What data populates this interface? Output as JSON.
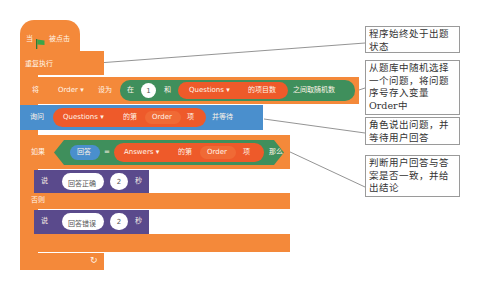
{
  "hat": {
    "prefix": "当",
    "flag_icon": "green-flag-icon",
    "suffix": "被点击"
  },
  "forever": {
    "label": "重复执行"
  },
  "set_block": {
    "verb": "将",
    "variable": "Order",
    "to_label": "设为",
    "random": {
      "prefix": "在",
      "min": "1",
      "and_label": "和",
      "list": "Questions",
      "list_suffix": "的项目数",
      "suffix": "之间取随机数"
    }
  },
  "ask_block": {
    "verb": "询问",
    "list": "Questions",
    "item_prefix": "的第",
    "index": "Order",
    "item_suffix": "项",
    "suffix": "并等待"
  },
  "if_block": {
    "if_label": "如果",
    "answer": "回答",
    "equals": "=",
    "list": "Answers",
    "item_prefix": "的第",
    "index": "Order",
    "item_suffix": "项",
    "then_label": "那么",
    "else_label": "否则"
  },
  "say_correct": {
    "verb": "说",
    "message": "回答正确",
    "seconds": "2",
    "unit": "秒"
  },
  "say_wrong": {
    "verb": "说",
    "message": "回答错误",
    "seconds": "2",
    "unit": "秒"
  },
  "loop_arrow_icon": "loop-arrow-icon",
  "notes": [
    {
      "text": "程序始终处于出题状态"
    },
    {
      "text": "从题库中随机选择一个问题，将问题序号存入变量Order中"
    },
    {
      "text": "角色说出问题，并等待用户回答"
    },
    {
      "text": "判断用户回答与答案是否一致，并给出结论"
    }
  ],
  "colors": {
    "events": "#f4893a",
    "control": "#f4893a",
    "operator": "#3f8f5c",
    "list": "#ee5a2a",
    "sensing": "#4a8fcd",
    "looks": "#5a4a8c"
  }
}
